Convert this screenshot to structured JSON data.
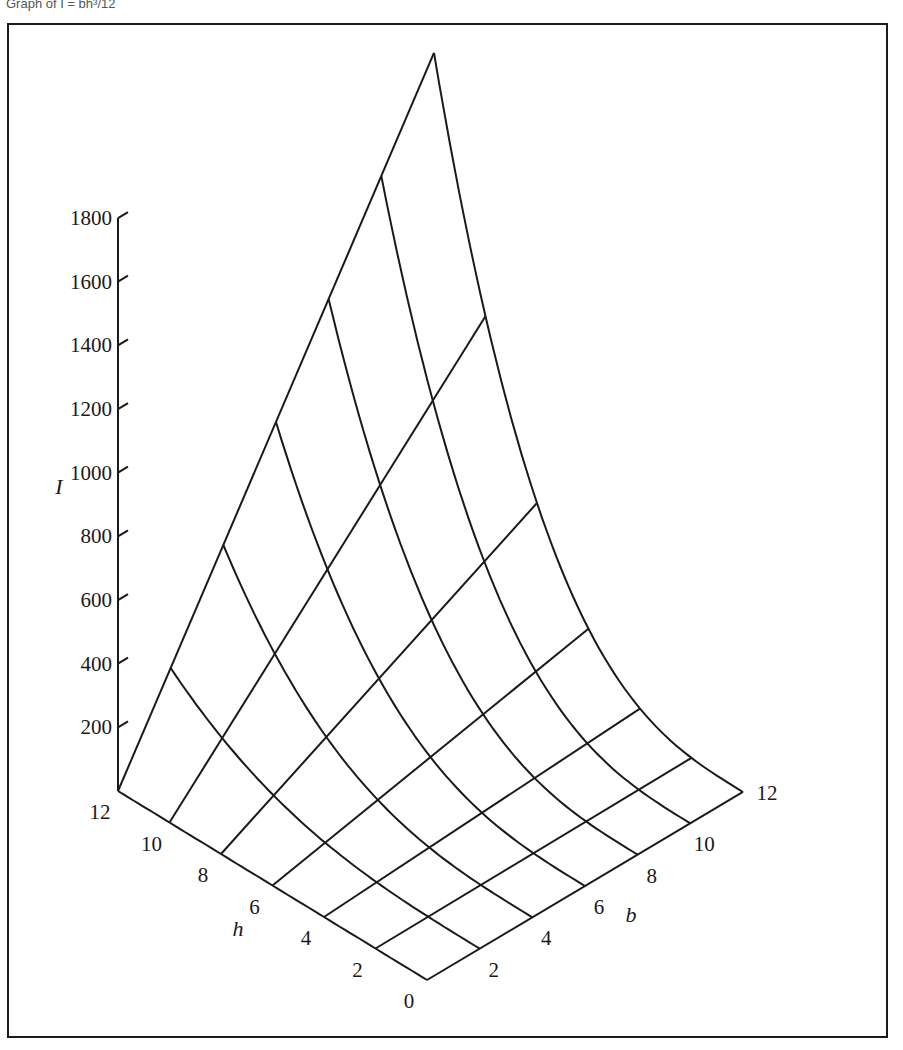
{
  "caption": "Graph of I = bh³/12",
  "chart_data": {
    "type": "surface3d",
    "function": "I = b*h^3/12",
    "title": "",
    "zlabel": "I",
    "xlabel": "h",
    "ylabel": "b",
    "z_ticks": [
      200,
      400,
      600,
      800,
      1000,
      1200,
      1400,
      1600,
      1800
    ],
    "h_ticks": [
      0,
      2,
      4,
      6,
      8,
      10,
      12
    ],
    "b_ticks": [
      0,
      2,
      4,
      6,
      8,
      10,
      12
    ],
    "zlim": [
      0,
      1800
    ],
    "hlim": [
      0,
      12
    ],
    "blim": [
      0,
      12
    ],
    "grid_step": 2,
    "surface_values": {
      "h": [
        0,
        2,
        4,
        6,
        8,
        10,
        12
      ],
      "b": [
        0,
        2,
        4,
        6,
        8,
        10,
        12
      ],
      "I_by_h_rows": [
        [
          0,
          0,
          0,
          0,
          0,
          0,
          0
        ],
        [
          0,
          1.33,
          2.67,
          4,
          5.33,
          6.67,
          8
        ],
        [
          0,
          10.67,
          21.33,
          32,
          42.67,
          53.33,
          64
        ],
        [
          0,
          36,
          72,
          108,
          144,
          180,
          216
        ],
        [
          0,
          85.33,
          170.67,
          256,
          341.33,
          426.67,
          512
        ],
        [
          0,
          166.67,
          333.33,
          500,
          666.67,
          833.33,
          1000
        ],
        [
          0,
          288,
          576,
          864,
          1152,
          1440,
          1728
        ]
      ]
    },
    "grid": false,
    "legend": "none"
  },
  "projection": {
    "origin": [
      427,
      980
    ],
    "h_unit": [
      -25.75,
      -15.75
    ],
    "b_unit": [
      26.33,
      -15.67
    ],
    "z_scale": 0.3183
  }
}
